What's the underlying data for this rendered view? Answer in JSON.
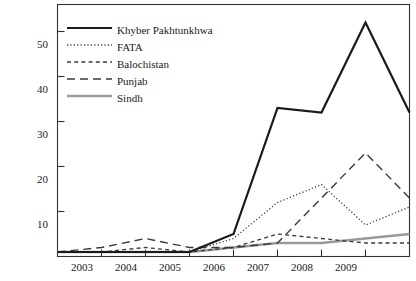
{
  "chart_data": {
    "type": "line",
    "title": "",
    "xlabel": "",
    "ylabel": "",
    "xlim": [
      2002,
      2010
    ],
    "ylim": [
      0,
      56
    ],
    "grid": false,
    "legend_position": "top-left-inside",
    "x": [
      2002,
      2003,
      2004,
      2005,
      2006,
      2007,
      2008,
      2009,
      2010
    ],
    "xticks": [
      "2003",
      "2004",
      "2005",
      "2006",
      "2007",
      "2008",
      "2009"
    ],
    "xtick_values": [
      2003,
      2004,
      2005,
      2006,
      2007,
      2008,
      2009
    ],
    "yticks": [
      "10",
      "20",
      "30",
      "40",
      "50"
    ],
    "ytick_values": [
      10,
      20,
      30,
      40,
      50
    ],
    "series": [
      {
        "name": "Khyber Pakhtunkhwa",
        "style": "solid",
        "color": "#1a1a1a",
        "width": 2.2,
        "values": [
          1,
          1,
          1,
          1,
          5,
          33,
          32,
          52,
          32
        ]
      },
      {
        "name": "FATA",
        "style": "dotted",
        "color": "#3a3a3a",
        "width": 1.3,
        "values": [
          1,
          1,
          1,
          1,
          4,
          12,
          16,
          7,
          11
        ]
      },
      {
        "name": "Balochistan",
        "style": "dashed-fine",
        "color": "#3a3a3a",
        "width": 1.3,
        "values": [
          1,
          1,
          2,
          1,
          2,
          5,
          4,
          3,
          3
        ]
      },
      {
        "name": "Punjab",
        "style": "dashed-long",
        "color": "#3a3a3a",
        "width": 1.4,
        "values": [
          1,
          2,
          4,
          2,
          2,
          3,
          13,
          23,
          13
        ]
      },
      {
        "name": "Sindh",
        "style": "solid-gray",
        "color": "#9a9a9a",
        "width": 2.6,
        "values": [
          1,
          1,
          1,
          1,
          2,
          3,
          3,
          4,
          5
        ]
      }
    ]
  },
  "axes": {
    "ytick_labels": [
      "50",
      "40",
      "30",
      "20",
      "10"
    ],
    "xtick_labels": [
      "2003",
      "2004",
      "2005",
      "2006",
      "2007",
      "2008",
      "2009"
    ]
  },
  "legend": {
    "items": [
      {
        "label": "Khyber Pakhtunkhwa"
      },
      {
        "label": "FATA"
      },
      {
        "label": "Balochistan"
      },
      {
        "label": "Punjab"
      },
      {
        "label": "Sindh"
      }
    ]
  }
}
